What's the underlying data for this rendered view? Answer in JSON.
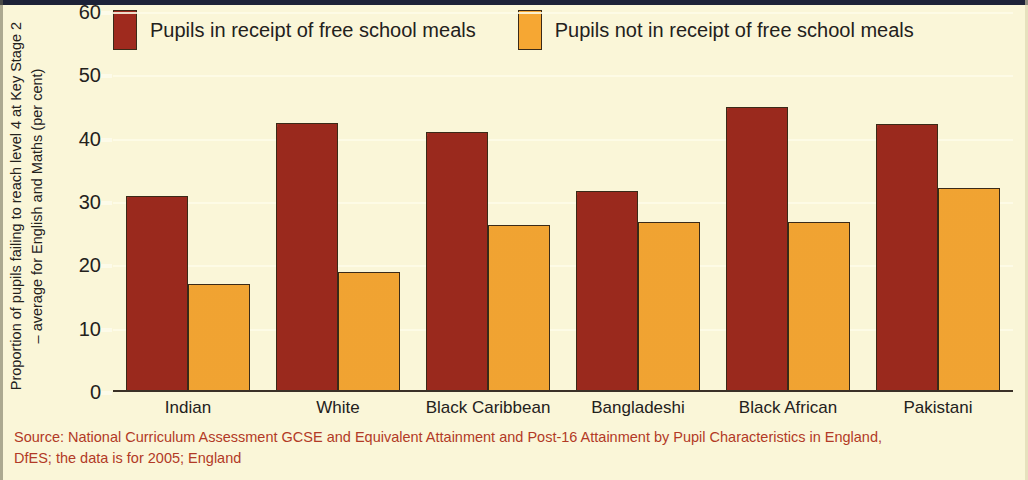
{
  "chart_data": {
    "type": "bar",
    "title": "",
    "subtitle": "",
    "xlabel": "",
    "ylabel": "Proportion of pupils failing to reach level 4 at Key Stage 2 – average for English and Maths (per cent)",
    "ylabel_line1": "Proportion of pupils failing to reach level 4 at Key Stage 2",
    "ylabel_line2": "– average for English and Maths (per cent)",
    "categories": [
      "Indian",
      "White",
      "Black Caribbean",
      "Bangladeshi",
      "Black African",
      "Pakistani"
    ],
    "series": [
      {
        "name": "Pupils in receipt of free school meals",
        "color": "#9f2a1e",
        "values": [
          31,
          42.5,
          41,
          31.7,
          45,
          42.3
        ]
      },
      {
        "name": "Pupils not in receipt of free school meals",
        "color": "#f6a733",
        "values": [
          17,
          19,
          26.3,
          26.8,
          26.8,
          32.2
        ]
      }
    ],
    "ylim": [
      0,
      60
    ],
    "ytick_values": [
      0,
      10,
      20,
      30,
      40,
      50,
      60
    ],
    "ytick_labels": [
      "0",
      "10",
      "20",
      "30",
      "40",
      "50",
      "60"
    ],
    "grid": true,
    "legend_position": "top",
    "background_color": "#faf6d8"
  },
  "legend": {
    "items": [
      {
        "label": "Pupils in receipt of free school meals",
        "swatch": "fsm"
      },
      {
        "label": "Pupils not in receipt of free school meals",
        "swatch": "nofsm"
      }
    ]
  },
  "source": {
    "line1": "Source: National Curriculum Assessment GCSE and Equivalent Attainment and Post-16 Attainment by Pupil Characteristics in England,",
    "line2": "DfES; the data is for 2005; England",
    "color": "#b23a26"
  }
}
